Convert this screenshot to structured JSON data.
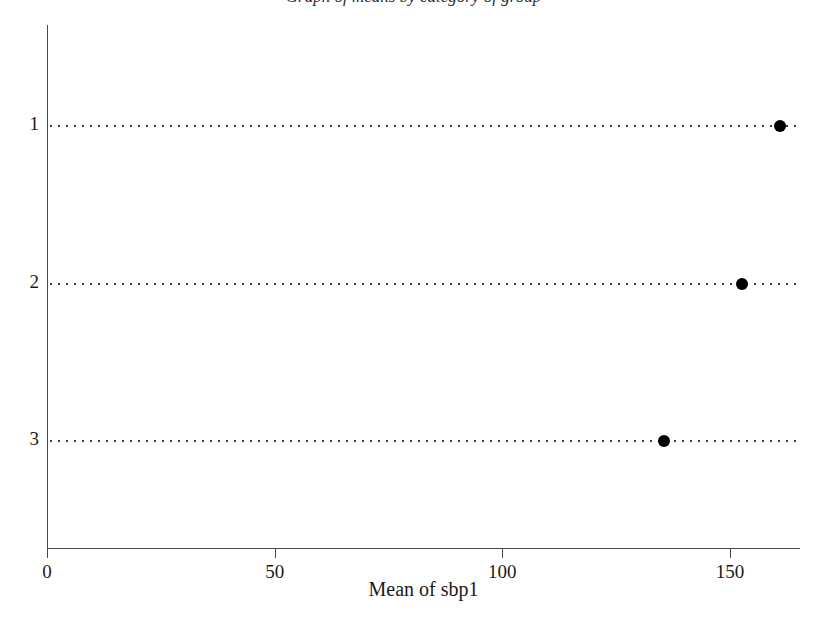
{
  "figure": {
    "title_fragment": "Graph of means by category of group",
    "background_color": "#ffffff",
    "axis_color": "#4a4a4a",
    "marker_color": "#000000",
    "gridline_color": "#3c3c3c"
  },
  "chart_data": {
    "type": "scatter",
    "title": "",
    "xlabel": "Mean of sbp1",
    "ylabel": "",
    "orientation": "horizontal",
    "grid": true,
    "grid_style": "dotted-horizontal",
    "legend": "none",
    "xlim": [
      0,
      165.4
    ],
    "xticks": [
      0,
      50,
      100,
      150
    ],
    "xtick_labels": [
      "0",
      "50",
      "100",
      "150"
    ],
    "categories": [
      "1",
      "2",
      "3"
    ],
    "values": [
      161.0,
      152.6,
      135.5
    ],
    "points": [
      {
        "category": "1",
        "value": 161.0
      },
      {
        "category": "2",
        "value": 152.6
      },
      {
        "category": "3",
        "value": 135.5
      }
    ]
  }
}
